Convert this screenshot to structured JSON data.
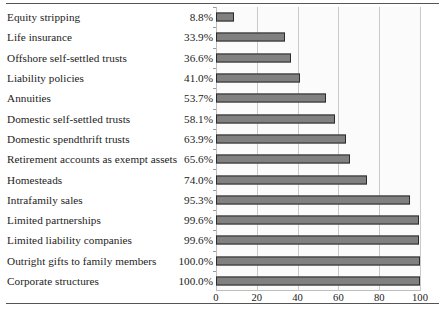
{
  "chart_data": {
    "type": "bar",
    "orientation": "horizontal",
    "title": "",
    "subtitle": "",
    "xlabel": "",
    "ylabel": "",
    "xlim": [
      0,
      100
    ],
    "ylim": null,
    "grid": true,
    "legend": null,
    "xticks": [
      0,
      20,
      40,
      60,
      80,
      100
    ],
    "xtick_labels": [
      "0",
      "20",
      "40",
      "60",
      "80",
      "100"
    ],
    "categories": [
      "Equity stripping",
      "Life insurance",
      "Offshore self-settled trusts",
      "Liability policies",
      "Annuities",
      "Domestic self-settled trusts",
      "Domestic spendthrift trusts",
      "Retirement accounts as exempt assets",
      "Homesteads",
      "Intrafamily sales",
      "Limited partnerships",
      "Limited liability companies",
      "Outright gifts to family members",
      "Corporate structures"
    ],
    "values": [
      8.8,
      33.9,
      36.6,
      41.0,
      53.7,
      58.1,
      63.9,
      65.6,
      74.0,
      95.3,
      99.6,
      99.6,
      100.0,
      100.0
    ],
    "value_labels": [
      "8.8%",
      "33.9%",
      "36.6%",
      "41.0%",
      "53.7%",
      "58.1%",
      "63.9%",
      "65.6%",
      "74.0%",
      "95.3%",
      "99.6%",
      "99.6%",
      "100.0%",
      "100.0%"
    ],
    "colors": {
      "bar_fill": "#808080",
      "bar_border": "#2b2b2b",
      "gridline": "#c9c9c9",
      "plot_background": "#fbfbfb",
      "text": "#222222",
      "rule": "#555555"
    }
  }
}
